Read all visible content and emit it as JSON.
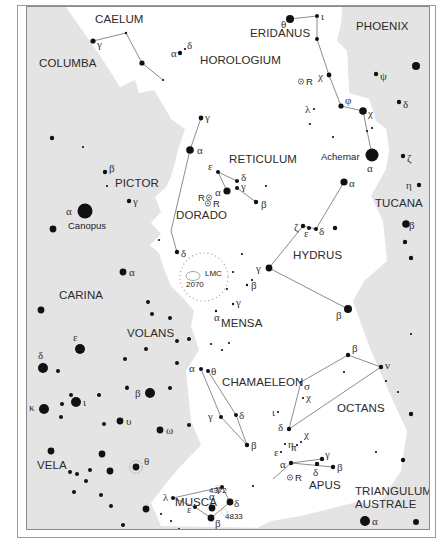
{
  "colors": {
    "background": "#ffffff",
    "shaded_region": "#e4e4e4",
    "star": "#111111",
    "line": "#6e6e6e",
    "frame": "#8a8a8a"
  },
  "constellations": [
    {
      "name": "CAELUM",
      "x": 94,
      "y": 22
    },
    {
      "name": "ERIDANUS",
      "x": 249,
      "y": 36
    },
    {
      "name": "PHOENIX",
      "x": 355,
      "y": 29
    },
    {
      "name": "COLUMBA",
      "x": 38,
      "y": 66
    },
    {
      "name": "HOROLOGIUM",
      "x": 199,
      "y": 63
    },
    {
      "name": "RETICULUM",
      "x": 228,
      "y": 162
    },
    {
      "name": "PICTOR",
      "x": 114,
      "y": 186
    },
    {
      "name": "DORADO",
      "x": 175,
      "y": 218
    },
    {
      "name": "TUCANA",
      "x": 374,
      "y": 206
    },
    {
      "name": "HYDRUS",
      "x": 292,
      "y": 258
    },
    {
      "name": "CARINA",
      "x": 58,
      "y": 298
    },
    {
      "name": "MENSA",
      "x": 220,
      "y": 326
    },
    {
      "name": "VOLANS",
      "x": 126,
      "y": 336
    },
    {
      "name": "CHAMAELEON",
      "x": 221,
      "y": 385
    },
    {
      "name": "OCTANS",
      "x": 336,
      "y": 411
    },
    {
      "name": "VELA",
      "x": 36,
      "y": 468
    },
    {
      "name": "APUS",
      "x": 308,
      "y": 488
    },
    {
      "name": "MUSCA",
      "x": 174,
      "y": 505
    },
    {
      "name": "TRIANGULUM",
      "x": 354,
      "y": 494
    },
    {
      "name": "AUSTRALE",
      "x": 354,
      "y": 507
    }
  ],
  "named_stars": [
    {
      "name": "Canopus",
      "x": 67,
      "y": 228
    },
    {
      "name": "Achernar",
      "x": 320,
      "y": 159
    }
  ],
  "deep_sky": [
    {
      "label": "LMC",
      "x": 204,
      "y": 275
    },
    {
      "label": "2070",
      "x": 185,
      "y": 286
    },
    {
      "label": "4372",
      "x": 208,
      "y": 492
    },
    {
      "label": "4833",
      "x": 224,
      "y": 518
    }
  ],
  "variables": [
    {
      "label": "R",
      "x": 305,
      "y": 84,
      "side": "right"
    },
    {
      "label": "R",
      "x": 197,
      "y": 200,
      "side": "left"
    },
    {
      "label": "R",
      "x": 212,
      "y": 206,
      "side": "right"
    },
    {
      "label": "R",
      "x": 294,
      "y": 480,
      "side": "right"
    }
  ],
  "stars": [
    {
      "x": 92,
      "y": 40,
      "r": 2.6,
      "label": "γ",
      "lx": 96,
      "ly": 47
    },
    {
      "x": 125,
      "y": 32,
      "r": 1.2
    },
    {
      "x": 141,
      "y": 62,
      "r": 2.6
    },
    {
      "x": 162,
      "y": 79,
      "r": 1.1
    },
    {
      "x": 179,
      "y": 52,
      "r": 2.2,
      "label": "α",
      "lx": 170,
      "ly": 56
    },
    {
      "x": 184,
      "y": 48,
      "r": 1.1,
      "label": "δ",
      "lx": 186,
      "ly": 48
    },
    {
      "x": 289,
      "y": 18,
      "r": 4.0,
      "label": "θ",
      "lx": 280,
      "ly": 27
    },
    {
      "x": 316,
      "y": 15,
      "r": 2.0,
      "label": "ι",
      "lx": 320,
      "ly": 19
    },
    {
      "x": 316,
      "y": 38,
      "r": 2.0
    },
    {
      "x": 328,
      "y": 74,
      "r": 2.4,
      "label": "χ",
      "lx": 317,
      "ly": 79
    },
    {
      "x": 340,
      "y": 105,
      "r": 2.6,
      "label": "φ",
      "lx": 344,
      "ly": 103
    },
    {
      "x": 362,
      "y": 110,
      "r": 3.8,
      "label": "χ",
      "lx": 367,
      "ly": 116
    },
    {
      "x": 375,
      "y": 73,
      "r": 2.2,
      "label": "ψ",
      "lx": 379,
      "ly": 79
    },
    {
      "x": 415,
      "y": 65,
      "r": 4.0
    },
    {
      "x": 398,
      "y": 101,
      "r": 2.2,
      "label": "δ",
      "lx": 402,
      "ly": 107
    },
    {
      "x": 313,
      "y": 108,
      "r": 1.1,
      "label": "λ",
      "lx": 304,
      "ly": 112
    },
    {
      "x": 309,
      "y": 123,
      "r": 1.1
    },
    {
      "x": 332,
      "y": 136,
      "r": 1.1
    },
    {
      "x": 371,
      "y": 127,
      "r": 1.1
    },
    {
      "x": 366,
      "y": 130,
      "r": 1.1
    },
    {
      "x": 371,
      "y": 154,
      "r": 6.5,
      "label": "α",
      "lx": 366,
      "ly": 171
    },
    {
      "x": 402,
      "y": 155,
      "r": 2.2,
      "label": "ζ",
      "lx": 406,
      "ly": 161
    },
    {
      "x": 418,
      "y": 184,
      "r": 2.2,
      "label": "η",
      "lx": 405,
      "ly": 188
    },
    {
      "x": 343,
      "y": 181,
      "r": 3.6,
      "label": "α",
      "lx": 348,
      "ly": 186
    },
    {
      "x": 334,
      "y": 227,
      "r": 2.2
    },
    {
      "x": 302,
      "y": 225,
      "r": 2.2,
      "label": "ζ",
      "lx": 293,
      "ly": 230
    },
    {
      "x": 308,
      "y": 227,
      "r": 2.0,
      "label": "ε",
      "lx": 303,
      "ly": 236
    },
    {
      "x": 315,
      "y": 228,
      "r": 2.0,
      "label": "δ",
      "lx": 318,
      "ly": 234
    },
    {
      "x": 405,
      "y": 223,
      "r": 3.8,
      "label": "β",
      "lx": 408,
      "ly": 228
    },
    {
      "x": 404,
      "y": 241,
      "r": 2.2
    },
    {
      "x": 410,
      "y": 257,
      "r": 2.2
    },
    {
      "x": 268,
      "y": 267,
      "r": 3.4,
      "label": "γ",
      "lx": 255,
      "ly": 271
    },
    {
      "x": 347,
      "y": 308,
      "r": 4.0,
      "label": "β",
      "lx": 335,
      "ly": 318
    },
    {
      "x": 200,
      "y": 117,
      "r": 2.4,
      "label": "γ",
      "lx": 204,
      "ly": 120
    },
    {
      "x": 189,
      "y": 149,
      "r": 3.8,
      "label": "α",
      "lx": 196,
      "ly": 153
    },
    {
      "x": 217,
      "y": 171,
      "r": 2.0,
      "label": "ε",
      "lx": 207,
      "ly": 169
    },
    {
      "x": 236,
      "y": 180,
      "r": 2.0,
      "label": "δ",
      "lx": 240,
      "ly": 180
    },
    {
      "x": 236,
      "y": 187,
      "r": 2.0,
      "label": "γ",
      "lx": 240,
      "ly": 189
    },
    {
      "x": 226,
      "y": 190,
      "r": 3.6,
      "label": "α",
      "lx": 214,
      "ly": 195
    },
    {
      "x": 255,
      "y": 201,
      "r": 2.2,
      "label": "β",
      "lx": 260,
      "ly": 207
    },
    {
      "x": 265,
      "y": 185,
      "r": 1.1
    },
    {
      "x": 176,
      "y": 251,
      "r": 2.2,
      "label": "δ",
      "lx": 180,
      "ly": 256
    },
    {
      "x": 158,
      "y": 239,
      "r": 1.1
    },
    {
      "x": 51,
      "y": 137,
      "r": 2.2
    },
    {
      "x": 82,
      "y": 146,
      "r": 1.1
    },
    {
      "x": 104,
      "y": 171,
      "r": 2.2,
      "label": "β",
      "lx": 108,
      "ly": 171
    },
    {
      "x": 106,
      "y": 185,
      "r": 1.1
    },
    {
      "x": 128,
      "y": 200,
      "r": 2.2,
      "label": "γ",
      "lx": 132,
      "ly": 204
    },
    {
      "x": 84,
      "y": 210,
      "r": 7.5,
      "label": "α",
      "lx": 65,
      "ly": 214
    },
    {
      "x": 52,
      "y": 228,
      "r": 3.4
    },
    {
      "x": 122,
      "y": 271,
      "r": 3.4,
      "label": "α",
      "lx": 128,
      "ly": 275
    },
    {
      "x": 40,
      "y": 309,
      "r": 3.4
    },
    {
      "x": 151,
      "y": 313,
      "r": 2.0
    },
    {
      "x": 169,
      "y": 317,
      "r": 2.0
    },
    {
      "x": 79,
      "y": 348,
      "r": 5.0,
      "label": "ε",
      "lx": 72,
      "ly": 340
    },
    {
      "x": 176,
      "y": 340,
      "r": 2.0
    },
    {
      "x": 145,
      "y": 348,
      "r": 2.0
    },
    {
      "x": 42,
      "y": 367,
      "r": 5.0,
      "label": "δ",
      "lx": 37,
      "ly": 358
    },
    {
      "x": 57,
      "y": 370,
      "r": 2.0
    },
    {
      "x": 124,
      "y": 358,
      "r": 2.0
    },
    {
      "x": 176,
      "y": 362,
      "r": 2.0
    },
    {
      "x": 149,
      "y": 392,
      "r": 5.0,
      "label": "β",
      "lx": 134,
      "ly": 396
    },
    {
      "x": 126,
      "y": 387,
      "r": 2.0
    },
    {
      "x": 169,
      "y": 387,
      "r": 2.0
    },
    {
      "x": 70,
      "y": 394,
      "r": 2.0
    },
    {
      "x": 75,
      "y": 401,
      "r": 5.0,
      "label": "ι",
      "lx": 82,
      "ly": 405
    },
    {
      "x": 61,
      "y": 403,
      "r": 2.0
    },
    {
      "x": 98,
      "y": 394,
      "r": 2.0
    },
    {
      "x": 43,
      "y": 408,
      "r": 5.0,
      "label": "κ",
      "lx": 28,
      "ly": 410
    },
    {
      "x": 60,
      "y": 416,
      "r": 2.0
    },
    {
      "x": 126,
      "y": 386,
      "r": 1.6
    },
    {
      "x": 119,
      "y": 420,
      "r": 3.4,
      "label": "υ",
      "lx": 125,
      "ly": 424
    },
    {
      "x": 103,
      "y": 423,
      "r": 2.0
    },
    {
      "x": 159,
      "y": 429,
      "r": 3.4,
      "label": "ω",
      "lx": 165,
      "ly": 433
    },
    {
      "x": 188,
      "y": 424,
      "r": 2.0
    },
    {
      "x": 50,
      "y": 450,
      "r": 3.4
    },
    {
      "x": 101,
      "y": 453,
      "r": 3.4
    },
    {
      "x": 135,
      "y": 466,
      "r": 3.4,
      "label": "θ",
      "lx": 143,
      "ly": 464,
      "ring": true
    },
    {
      "x": 109,
      "y": 470,
      "r": 3.4
    },
    {
      "x": 69,
      "y": 471,
      "r": 2.0
    },
    {
      "x": 76,
      "y": 473,
      "r": 2.0
    },
    {
      "x": 89,
      "y": 469,
      "r": 2.0
    },
    {
      "x": 85,
      "y": 480,
      "r": 2.0
    },
    {
      "x": 73,
      "y": 491,
      "r": 2.0
    },
    {
      "x": 100,
      "y": 494,
      "r": 2.0
    },
    {
      "x": 110,
      "y": 505,
      "r": 2.0
    },
    {
      "x": 145,
      "y": 508,
      "r": 3.4
    },
    {
      "x": 160,
      "y": 513,
      "r": 1.1
    },
    {
      "x": 122,
      "y": 524,
      "r": 2.0
    },
    {
      "x": 170,
      "y": 520,
      "r": 1.1
    },
    {
      "x": 178,
      "y": 528,
      "r": 1.1
    },
    {
      "x": 251,
      "y": 279,
      "r": 1.1
    },
    {
      "x": 232,
      "y": 271,
      "r": 1.1
    },
    {
      "x": 241,
      "y": 253,
      "r": 1.1
    },
    {
      "x": 226,
      "y": 288,
      "r": 1.1
    },
    {
      "x": 246,
      "y": 284,
      "r": 1.2,
      "label": "β",
      "lx": 250,
      "ly": 288
    },
    {
      "x": 232,
      "y": 303,
      "r": 1.2,
      "label": "γ",
      "lx": 235,
      "ly": 305
    },
    {
      "x": 215,
      "y": 310,
      "r": 1.2,
      "label": "α",
      "lx": 213,
      "ly": 320
    },
    {
      "x": 228,
      "y": 342,
      "r": 1.1
    },
    {
      "x": 221,
      "y": 349,
      "r": 1.1
    },
    {
      "x": 210,
      "y": 343,
      "r": 1.1
    },
    {
      "x": 200,
      "y": 368,
      "r": 2.0,
      "label": "α",
      "lx": 188,
      "ly": 371
    },
    {
      "x": 207,
      "y": 370,
      "r": 2.0,
      "label": "θ",
      "lx": 210,
      "ly": 374
    },
    {
      "x": 220,
      "y": 416,
      "r": 2.0,
      "label": "γ",
      "lx": 207,
      "ly": 419
    },
    {
      "x": 235,
      "y": 414,
      "r": 2.0,
      "label": "δ",
      "lx": 238,
      "ly": 418
    },
    {
      "x": 246,
      "y": 444,
      "r": 2.2,
      "label": "β",
      "lx": 250,
      "ly": 448
    },
    {
      "x": 147,
      "y": 301,
      "r": 2.0
    },
    {
      "x": 188,
      "y": 338,
      "r": 2.0
    },
    {
      "x": 347,
      "y": 354,
      "r": 2.2,
      "label": "β",
      "lx": 351,
      "ly": 351
    },
    {
      "x": 380,
      "y": 366,
      "r": 2.2,
      "label": "ν",
      "lx": 384,
      "ly": 368
    },
    {
      "x": 343,
      "y": 371,
      "r": 1.1
    },
    {
      "x": 300,
      "y": 381,
      "r": 1.1,
      "label": "σ",
      "lx": 303,
      "ly": 389
    },
    {
      "x": 302,
      "y": 397,
      "r": 1.1,
      "label": "χ",
      "lx": 305,
      "ly": 400
    },
    {
      "x": 385,
      "y": 380,
      "r": 1.1
    },
    {
      "x": 397,
      "y": 391,
      "r": 1.1
    },
    {
      "x": 410,
      "y": 333,
      "r": 1.1
    },
    {
      "x": 277,
      "y": 411,
      "r": 1.1,
      "label": "ι",
      "lx": 271,
      "ly": 415
    },
    {
      "x": 288,
      "y": 428,
      "r": 2.2,
      "label": "δ",
      "lx": 277,
      "ly": 430
    },
    {
      "x": 300,
      "y": 441,
      "r": 1.1,
      "label": "χ",
      "lx": 303,
      "ly": 437
    },
    {
      "x": 296,
      "y": 444,
      "r": 1.1,
      "label": "π",
      "lx": 290,
      "ly": 450
    },
    {
      "x": 284,
      "y": 443,
      "r": 1.1,
      "label": "η",
      "lx": 287,
      "ly": 447
    },
    {
      "x": 280,
      "y": 451,
      "r": 1.1,
      "label": "ε",
      "lx": 273,
      "ly": 455
    },
    {
      "x": 290,
      "y": 462,
      "r": 2.2,
      "label": "α",
      "lx": 279,
      "ly": 467
    },
    {
      "x": 321,
      "y": 458,
      "r": 2.2,
      "label": "γ",
      "lx": 324,
      "ly": 457
    },
    {
      "x": 316,
      "y": 463,
      "r": 2.2,
      "label": "δ",
      "lx": 312,
      "ly": 475
    },
    {
      "x": 332,
      "y": 466,
      "r": 2.2,
      "label": "β",
      "lx": 336,
      "ly": 470
    },
    {
      "x": 252,
      "y": 485,
      "r": 1.1
    },
    {
      "x": 410,
      "y": 413,
      "r": 2.2
    },
    {
      "x": 375,
      "y": 451,
      "r": 1.1
    },
    {
      "x": 402,
      "y": 459,
      "r": 2.2
    },
    {
      "x": 364,
      "y": 520,
      "r": 5.0,
      "label": "α",
      "lx": 371,
      "ly": 524
    },
    {
      "x": 415,
      "y": 521,
      "r": 3.0
    },
    {
      "x": 221,
      "y": 486,
      "r": 2.0,
      "label": "γ",
      "lx": 215,
      "ly": 491
    },
    {
      "x": 172,
      "y": 497,
      "r": 2.0,
      "label": "λ",
      "lx": 162,
      "ly": 500
    },
    {
      "x": 194,
      "y": 506,
      "r": 2.0,
      "label": "ε",
      "lx": 186,
      "ly": 512
    },
    {
      "x": 211,
      "y": 507,
      "r": 3.4,
      "label": "α",
      "lx": 208,
      "ly": 499
    },
    {
      "x": 229,
      "y": 501,
      "r": 3.4,
      "label": "δ",
      "lx": 233,
      "ly": 506
    },
    {
      "x": 210,
      "y": 517,
      "r": 3.4,
      "label": "β",
      "lx": 214,
      "ly": 526
    }
  ],
  "lines": [
    [
      [
        92,
        40
      ],
      [
        125,
        32
      ],
      [
        141,
        62
      ],
      [
        162,
        79
      ]
    ],
    [
      [
        289,
        18
      ],
      [
        316,
        15
      ]
    ],
    [
      [
        316,
        15
      ],
      [
        316,
        38
      ],
      [
        328,
        74
      ],
      [
        340,
        105
      ],
      [
        362,
        110
      ],
      [
        371,
        154
      ]
    ],
    [
      [
        200,
        117
      ],
      [
        189,
        149
      ],
      [
        170,
        230
      ],
      [
        176,
        251
      ]
    ],
    [
      [
        217,
        171
      ],
      [
        236,
        180
      ]
    ],
    [
      [
        217,
        171
      ],
      [
        226,
        190
      ]
    ],
    [
      [
        236,
        187
      ],
      [
        255,
        201
      ]
    ],
    [
      [
        343,
        181
      ],
      [
        315,
        228
      ],
      [
        302,
        225
      ],
      [
        268,
        267
      ],
      [
        347,
        308
      ]
    ],
    [
      [
        200,
        368
      ],
      [
        220,
        416
      ],
      [
        246,
        444
      ]
    ],
    [
      [
        207,
        370
      ],
      [
        235,
        414
      ],
      [
        246,
        444
      ]
    ],
    [
      [
        288,
        428
      ],
      [
        300,
        381
      ],
      [
        347,
        354
      ],
      [
        380,
        366
      ],
      [
        288,
        428
      ]
    ],
    [
      [
        290,
        462
      ],
      [
        321,
        458
      ]
    ],
    [
      [
        290,
        462
      ],
      [
        332,
        466
      ]
    ],
    [
      [
        290,
        462
      ],
      [
        272,
        478
      ]
    ],
    [
      [
        172,
        497
      ],
      [
        221,
        486
      ],
      [
        229,
        501
      ]
    ],
    [
      [
        172,
        497
      ],
      [
        194,
        506
      ],
      [
        210,
        517
      ],
      [
        229,
        501
      ]
    ]
  ]
}
